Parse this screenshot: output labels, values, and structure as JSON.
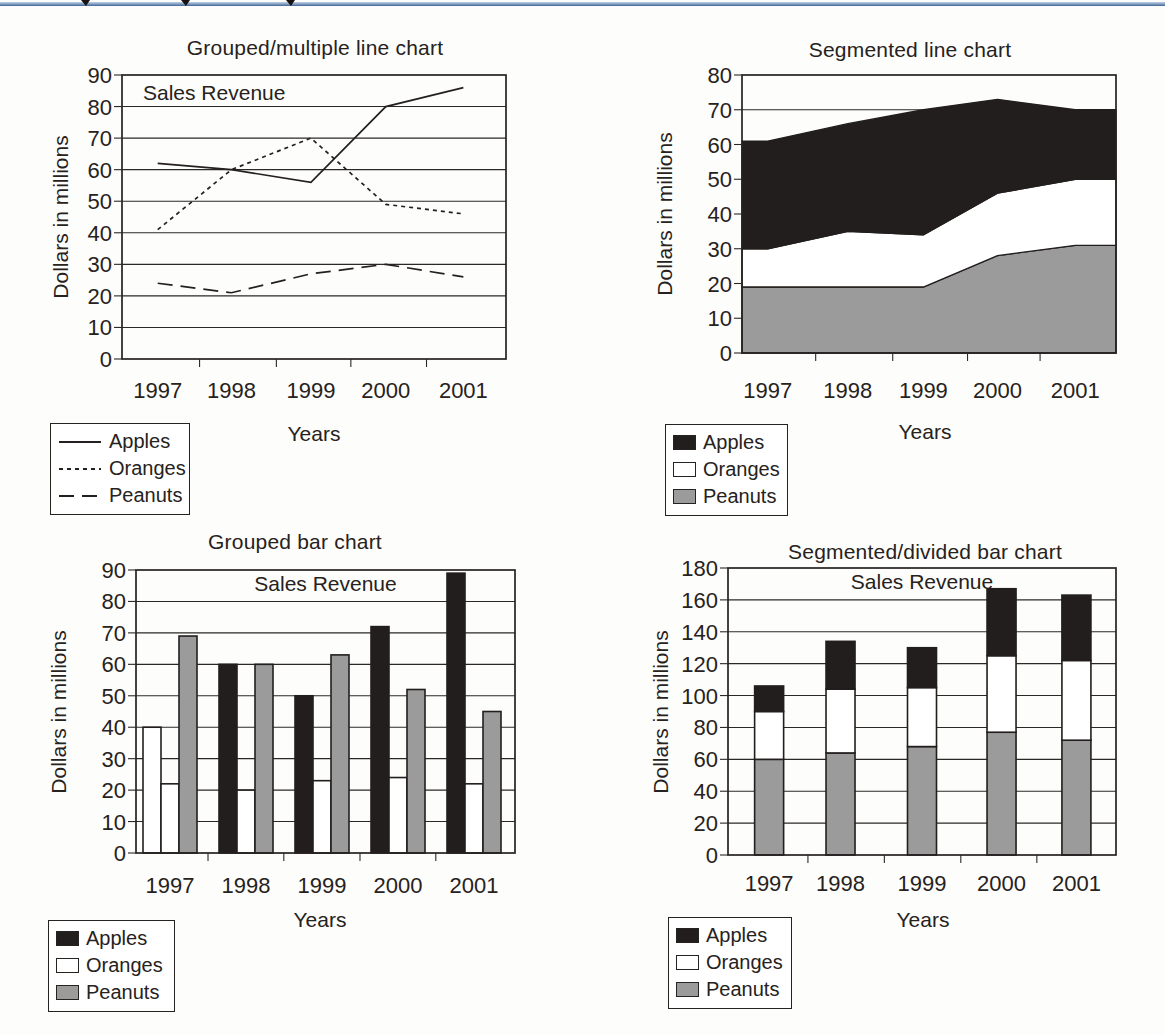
{
  "page": {
    "top_rule_color": "#6d8fba",
    "text_color": "#262220",
    "background": "#fdfdfb"
  },
  "chart_data": [
    {
      "type": "line",
      "title": "Grouped/multiple line chart",
      "annotation": "Sales Revenue",
      "xlabel": "Years",
      "ylabel": "Dollars in millions",
      "ylim": [
        0,
        90
      ],
      "yticks": [
        0,
        10,
        20,
        30,
        40,
        50,
        60,
        70,
        80,
        90
      ],
      "grid": "horizontal",
      "legend_position": "below-left",
      "categories": [
        "1997",
        "1998",
        "1999",
        "2000",
        "2001"
      ],
      "series": [
        {
          "name": "Apples",
          "line_style": "solid",
          "values": [
            62,
            60,
            56,
            80,
            86
          ]
        },
        {
          "name": "Oranges",
          "line_style": "dotted",
          "values": [
            41,
            60,
            70,
            49,
            46
          ]
        },
        {
          "name": "Peanuts",
          "line_style": "dashed",
          "values": [
            24,
            21,
            27,
            30,
            26
          ]
        }
      ],
      "legend": [
        {
          "label": "Apples",
          "line_style": "solid"
        },
        {
          "label": "Oranges",
          "line_style": "dotted"
        },
        {
          "label": "Peanuts",
          "line_style": "dashed"
        }
      ]
    },
    {
      "type": "area",
      "title": "Segmented line chart",
      "xlabel": "Years",
      "ylabel": "Dollars in millions",
      "ylim": [
        0,
        80
      ],
      "yticks": [
        0,
        10,
        20,
        30,
        40,
        50,
        60,
        70,
        80
      ],
      "grid": "horizontal",
      "stacking": "bottom-to-top: Peanuts, Oranges, Apples",
      "legend_position": "below-left",
      "categories": [
        "1997",
        "1998",
        "1999",
        "2000",
        "2001"
      ],
      "series": [
        {
          "name": "Peanuts",
          "color": "#9b9b9b",
          "values": [
            19,
            19,
            19,
            28,
            31
          ]
        },
        {
          "name": "Oranges",
          "color": "#ffffff",
          "values": [
            11,
            16,
            15,
            18,
            19
          ]
        },
        {
          "name": "Apples",
          "color": "#221e1d",
          "values": [
            31,
            31,
            36,
            27,
            20
          ]
        }
      ],
      "legend": [
        {
          "label": "Apples",
          "swatch": "#221e1d"
        },
        {
          "label": "Oranges",
          "swatch": "#ffffff"
        },
        {
          "label": "Peanuts",
          "swatch": "#9b9b9b"
        }
      ]
    },
    {
      "type": "bar",
      "title": "Grouped bar chart",
      "annotation": "Sales Revenue",
      "xlabel": "Years",
      "ylabel": "Dollars in millions",
      "ylim": [
        0,
        90
      ],
      "yticks": [
        0,
        10,
        20,
        30,
        40,
        50,
        60,
        70,
        80,
        90
      ],
      "grid": "horizontal",
      "legend_position": "below-left",
      "categories": [
        "1997",
        "1998",
        "1999",
        "2000",
        "2001"
      ],
      "series": [
        {
          "name": "Apples",
          "color": "#221e1d",
          "values": [
            40,
            60,
            50,
            72,
            89
          ],
          "fill_overrides": {
            "0": "#ffffff"
          }
        },
        {
          "name": "Oranges",
          "color": "#ffffff",
          "values": [
            22,
            20,
            23,
            24,
            22
          ]
        },
        {
          "name": "Peanuts",
          "color": "#9b9b9b",
          "values": [
            69,
            60,
            63,
            52,
            45
          ]
        }
      ],
      "legend": [
        {
          "label": "Apples",
          "swatch": "#221e1d"
        },
        {
          "label": "Oranges",
          "swatch": "#ffffff"
        },
        {
          "label": "Peanuts",
          "swatch": "#9b9b9b"
        }
      ]
    },
    {
      "type": "stacked_bar",
      "title": "Segmented/divided bar chart",
      "annotation": "Sales Revenue",
      "xlabel": "Years",
      "ylabel": "Dollars in millions",
      "ylim": [
        0,
        180
      ],
      "yticks": [
        0,
        20,
        40,
        60,
        80,
        100,
        120,
        140,
        160,
        180
      ],
      "grid": "horizontal",
      "stacking": "bottom-to-top: Peanuts, Oranges, Apples",
      "legend_position": "below-left",
      "categories": [
        "1997",
        "1998",
        "1999",
        "2000",
        "2001"
      ],
      "series": [
        {
          "name": "Peanuts",
          "color": "#9b9b9b",
          "values": [
            60,
            64,
            68,
            77,
            72
          ]
        },
        {
          "name": "Oranges",
          "color": "#ffffff",
          "values": [
            30,
            40,
            37,
            48,
            50
          ]
        },
        {
          "name": "Apples",
          "color": "#221e1d",
          "values": [
            16,
            30,
            25,
            42,
            41
          ]
        }
      ],
      "legend": [
        {
          "label": "Apples",
          "swatch": "#221e1d"
        },
        {
          "label": "Oranges",
          "swatch": "#ffffff"
        },
        {
          "label": "Peanuts",
          "swatch": "#9b9b9b"
        }
      ]
    }
  ]
}
